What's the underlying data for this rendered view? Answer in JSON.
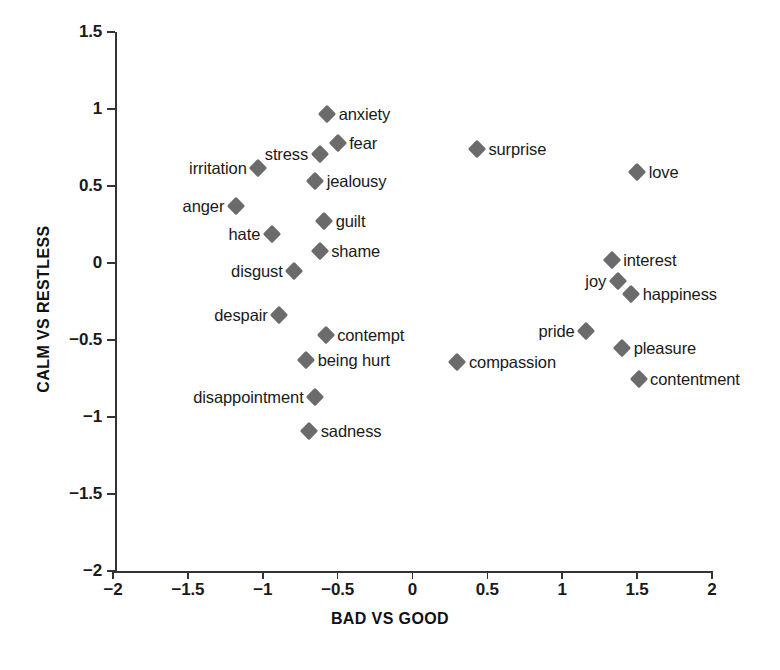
{
  "chart_data": {
    "type": "scatter",
    "title": "",
    "xlabel": "BAD VS GOOD",
    "ylabel": "CALM VS RESTLESS",
    "xlim": [
      -2,
      2
    ],
    "ylim": [
      -2,
      1.5
    ],
    "xticks": [
      "-2",
      "-1.5",
      "-1",
      "-0.5",
      "0",
      "0.5",
      "1",
      "1.5",
      "2"
    ],
    "xtick_values": [
      -2,
      -1.5,
      -1,
      -0.5,
      0,
      0.5,
      1,
      1.5,
      2
    ],
    "yticks": [
      "1.5",
      "1",
      "0.5",
      "0",
      "-0.5",
      "-1",
      "-1.5",
      "-2"
    ],
    "ytick_values": [
      1.5,
      1,
      0.5,
      0,
      -0.5,
      -1,
      -1.5,
      -2
    ],
    "grid": false,
    "legend": null,
    "marker": "diamond",
    "marker_color": "#6b6b6b",
    "points": [
      {
        "label": "anxiety",
        "x": -0.57,
        "y": 0.97,
        "label_side": "right"
      },
      {
        "label": "fear",
        "x": -0.5,
        "y": 0.78,
        "label_side": "right"
      },
      {
        "label": "stress",
        "x": -0.62,
        "y": 0.71,
        "label_side": "left"
      },
      {
        "label": "irritation",
        "x": -1.03,
        "y": 0.62,
        "label_side": "left"
      },
      {
        "label": "jealousy",
        "x": -0.65,
        "y": 0.53,
        "label_side": "right"
      },
      {
        "label": "anger",
        "x": -1.18,
        "y": 0.37,
        "label_side": "left"
      },
      {
        "label": "guilt",
        "x": -0.59,
        "y": 0.27,
        "label_side": "right"
      },
      {
        "label": "hate",
        "x": -0.94,
        "y": 0.19,
        "label_side": "left"
      },
      {
        "label": "shame",
        "x": -0.62,
        "y": 0.08,
        "label_side": "right"
      },
      {
        "label": "disgust",
        "x": -0.79,
        "y": -0.05,
        "label_side": "left"
      },
      {
        "label": "surprise",
        "x": 0.43,
        "y": 0.74,
        "label_side": "right"
      },
      {
        "label": "love",
        "x": 1.5,
        "y": 0.59,
        "label_side": "right"
      },
      {
        "label": "interest",
        "x": 1.33,
        "y": 0.02,
        "label_side": "right"
      },
      {
        "label": "joy",
        "x": 1.37,
        "y": -0.12,
        "label_side": "left"
      },
      {
        "label": "happiness",
        "x": 1.46,
        "y": -0.2,
        "label_side": "right"
      },
      {
        "label": "despair",
        "x": -0.89,
        "y": -0.34,
        "label_side": "left"
      },
      {
        "label": "pride",
        "x": 1.16,
        "y": -0.44,
        "label_side": "left"
      },
      {
        "label": "contempt",
        "x": -0.58,
        "y": -0.47,
        "label_side": "right"
      },
      {
        "label": "pleasure",
        "x": 1.4,
        "y": -0.55,
        "label_side": "right"
      },
      {
        "label": "being hurt",
        "x": -0.71,
        "y": -0.63,
        "label_side": "right"
      },
      {
        "label": "compassion",
        "x": 0.3,
        "y": -0.64,
        "label_side": "right"
      },
      {
        "label": "contentment",
        "x": 1.51,
        "y": -0.75,
        "label_side": "right"
      },
      {
        "label": "disappointment",
        "x": -0.65,
        "y": -0.87,
        "label_side": "left"
      },
      {
        "label": "sadness",
        "x": -0.69,
        "y": -1.09,
        "label_side": "right"
      }
    ]
  }
}
